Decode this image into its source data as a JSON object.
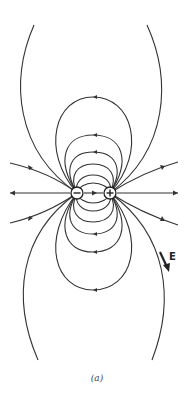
{
  "diagram": {
    "charges": [
      {
        "sign": "-",
        "x": 77,
        "y": 193
      },
      {
        "sign": "+",
        "x": 110,
        "y": 193
      }
    ],
    "field_label": "E",
    "caption": "(a)"
  }
}
